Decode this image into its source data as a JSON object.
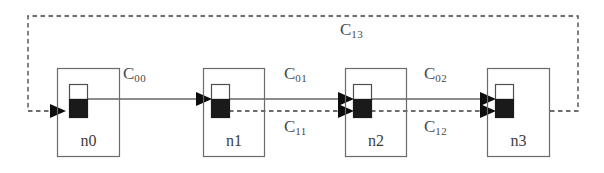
{
  "diagram": {
    "colors": {
      "stroke": "#555555",
      "node_border": "#6b6b6b",
      "fill_black": "#1a1a1a",
      "fill_white": "#ffffff",
      "dashed": "#3f3f3f",
      "text": "#4a4a4a",
      "background": "#ffffff"
    },
    "nodes": [
      {
        "id": "n0",
        "label": "n0",
        "x": 57,
        "y": 68,
        "w": 63,
        "h": 89
      },
      {
        "id": "n1",
        "label": "n1",
        "x": 203,
        "y": 68,
        "w": 62,
        "h": 89
      },
      {
        "id": "n2",
        "label": "n2",
        "x": 345,
        "y": 68,
        "w": 62,
        "h": 89
      },
      {
        "id": "n3",
        "label": "n3",
        "x": 487,
        "y": 68,
        "w": 63,
        "h": 89
      }
    ],
    "channel_labels": [
      {
        "id": "c00",
        "base": "C",
        "sub": "00",
        "x": 123,
        "y": 65
      },
      {
        "id": "c01",
        "base": "C",
        "sub": "01",
        "x": 284,
        "y": 65
      },
      {
        "id": "c02",
        "base": "C",
        "sub": "02",
        "x": 424,
        "y": 65
      },
      {
        "id": "c11",
        "base": "C",
        "sub": "11",
        "x": 284,
        "y": 118
      },
      {
        "id": "c12",
        "base": "C",
        "sub": "12",
        "x": 424,
        "y": 118
      },
      {
        "id": "c13",
        "base": "C",
        "sub": "13",
        "x": 340,
        "y": 21
      }
    ],
    "edges": [
      {
        "id": "c00-edge",
        "kind": "solid",
        "from": "n0",
        "to": "n1"
      },
      {
        "id": "c01-edge",
        "kind": "solid",
        "from": "n1",
        "to": "n2"
      },
      {
        "id": "c02-edge",
        "kind": "solid",
        "from": "n2",
        "to": "n3"
      },
      {
        "id": "c11-edge",
        "kind": "dashed",
        "from": "n1",
        "to": "n2"
      },
      {
        "id": "c12-edge",
        "kind": "dashed",
        "from": "n2",
        "to": "n3"
      },
      {
        "id": "c13-edge",
        "kind": "dashed",
        "from": "n3",
        "to": "n0"
      }
    ]
  }
}
